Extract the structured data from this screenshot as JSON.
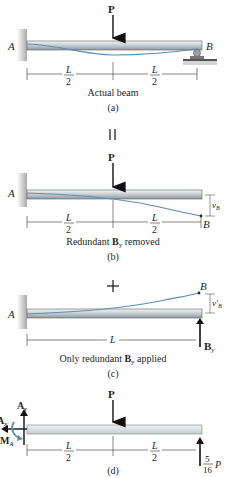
{
  "figure": {
    "panels": [
      {
        "id": "a",
        "caption": "Actual beam",
        "label": "(a)",
        "load": "P",
        "support_left": "A",
        "support_right": "B",
        "dims": [
          {
            "num": "L",
            "den": "2"
          },
          {
            "num": "L",
            "den": "2"
          }
        ]
      },
      {
        "id": "equals",
        "symbol": "||"
      },
      {
        "id": "b",
        "caption_pre": "Redundant ",
        "caption_bold": "B",
        "caption_sub": "y",
        "caption_post": " removed",
        "label": "(b)",
        "load": "P",
        "support_left": "A",
        "end_label": "B",
        "deflection_label": "v",
        "deflection_sub": "B",
        "dims": [
          {
            "num": "L",
            "den": "2"
          },
          {
            "num": "L",
            "den": "2"
          }
        ]
      },
      {
        "id": "plus",
        "symbol": "+"
      },
      {
        "id": "c",
        "caption_pre": "Only redundant ",
        "caption_bold": "B",
        "caption_sub": "y",
        "caption_post": " applied",
        "label": "(c)",
        "support_left": "A",
        "end_label": "B",
        "deflection_label": "v′",
        "deflection_sub": "B",
        "force_label": "B",
        "force_sub": "y",
        "dim": "L"
      },
      {
        "id": "d",
        "label": "(d)",
        "load": "P",
        "reaction_ay": "A",
        "reaction_ay_sub": "y",
        "reaction_ax": "A",
        "reaction_ax_sub": "x",
        "moment": "M",
        "moment_sub": "A",
        "reaction_b_num": "5",
        "reaction_b_den": "16",
        "reaction_b_var": "P",
        "dims": [
          {
            "num": "L",
            "den": "2"
          },
          {
            "num": "L",
            "den": "2"
          }
        ]
      }
    ],
    "colors": {
      "beam_top": "#e9ecee",
      "beam_bottom": "#9aa3a8",
      "beam_edge": "#4a5258",
      "elastic_curve": "#5b8fb5",
      "wall": "#b9b9b9",
      "text": "#231f20"
    }
  }
}
